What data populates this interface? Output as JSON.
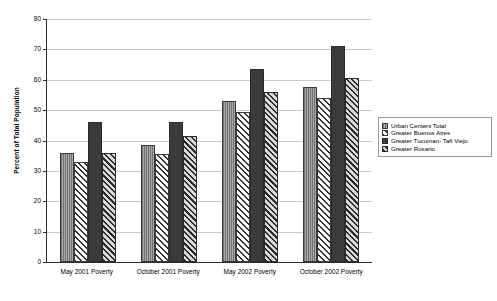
{
  "chart_data": {
    "type": "bar",
    "title": "",
    "xlabel": "",
    "ylabel": "Percent of Total Population",
    "ylim": [
      0,
      80
    ],
    "yticks": [
      0,
      10,
      20,
      30,
      40,
      50,
      60,
      70,
      80
    ],
    "grid": true,
    "legend_position": "right",
    "categories": [
      "May 2001 Poverty",
      "October 2001 Poverty",
      "May 2002 Poverty",
      "October 2002 Poverty"
    ],
    "series": [
      {
        "name": "Urban Centers Total",
        "pattern": "light-grey-vertical-lines",
        "values": [
          36.0,
          38.5,
          53.0,
          57.5
        ]
      },
      {
        "name": "Greater Buenos Aires",
        "pattern": "white-diagonal-hatch",
        "values": [
          33.0,
          35.5,
          49.5,
          54.0
        ]
      },
      {
        "name": "Greater Tucuman- Tafi Viejo",
        "pattern": "solid-dark",
        "values": [
          46.0,
          46.0,
          63.5,
          71.0
        ]
      },
      {
        "name": "Greater Rosario",
        "pattern": "dark-diagonal-hatch",
        "values": [
          36.0,
          41.5,
          56.0,
          60.5
        ]
      }
    ]
  },
  "legend": {
    "items": [
      {
        "label": "Urban Centers Total"
      },
      {
        "label": "Greater Buenos Aires"
      },
      {
        "label": "Greater Tucuman- Tafi Viejo"
      },
      {
        "label": "Greater Rosario"
      }
    ]
  },
  "colors": {
    "axis": "#2b2b2b",
    "grid": "#c9c9c9",
    "series_1": "#a8a8a8",
    "series_2": "#ffffff",
    "series_3": "#3b3b3b",
    "series_4": "#6d6d6d",
    "background": "#ffffff"
  }
}
